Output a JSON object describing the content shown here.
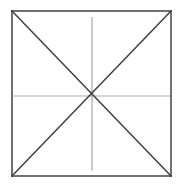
{
  "figure": {
    "background_color": "#ffffff",
    "canvas": {
      "width": 181,
      "height": 189
    },
    "square": {
      "name": "outer-square",
      "left": 12,
      "top": 11,
      "right": 171,
      "bottom": 176,
      "width": 159,
      "height": 165,
      "stroke_color": "#4e4e4e",
      "stroke_width": 1.6,
      "fill": "none",
      "corners": {
        "top_left": [
          12,
          11
        ],
        "top_right": [
          171,
          11
        ],
        "bottom_right": [
          171,
          176
        ],
        "bottom_left": [
          12,
          176
        ]
      }
    },
    "center_point": {
      "name": "center",
      "x": 92,
      "y": 96
    },
    "diagonals": [
      {
        "name": "diagonal-top-left-to-bottom-right",
        "x1": 12,
        "y1": 11,
        "x2": 171,
        "y2": 176,
        "stroke_color": "#3f3f3f",
        "stroke_width": 1.5
      },
      {
        "name": "diagonal-bottom-left-to-top-right",
        "x1": 12,
        "y1": 176,
        "x2": 171,
        "y2": 11,
        "stroke_color": "#3f3f3f",
        "stroke_width": 1.5
      }
    ],
    "medians": [
      {
        "name": "horizontal-median",
        "x1": 14,
        "y1": 96,
        "x2": 170,
        "y2": 96,
        "stroke_color": "#a9a9a9",
        "stroke_width": 1.2
      },
      {
        "name": "vertical-median",
        "x1": 92,
        "y1": 17,
        "x2": 92,
        "y2": 171,
        "stroke_color": "#a9a9a9",
        "stroke_width": 1.2
      }
    ],
    "labels": {
      "has_text": false,
      "text_items": []
    }
  },
  "chart_data": {
    "type": "diagram",
    "shapes": [
      {
        "kind": "square",
        "points": [
          [
            12,
            11
          ],
          [
            171,
            11
          ],
          [
            171,
            176
          ],
          [
            12,
            176
          ]
        ],
        "stroke": "#4e4e4e"
      },
      {
        "kind": "line",
        "role": "diagonal",
        "points": [
          [
            12,
            11
          ],
          [
            171,
            176
          ]
        ],
        "stroke": "#3f3f3f"
      },
      {
        "kind": "line",
        "role": "diagonal",
        "points": [
          [
            12,
            176
          ],
          [
            171,
            11
          ]
        ],
        "stroke": "#3f3f3f"
      },
      {
        "kind": "line",
        "role": "median",
        "points": [
          [
            14,
            96
          ],
          [
            170,
            96
          ]
        ],
        "stroke": "#a9a9a9"
      },
      {
        "kind": "line",
        "role": "median",
        "points": [
          [
            92,
            17
          ],
          [
            92,
            171
          ]
        ],
        "stroke": "#a9a9a9"
      }
    ],
    "annotations": [],
    "xlabel": "",
    "ylabel": "",
    "legend": []
  }
}
